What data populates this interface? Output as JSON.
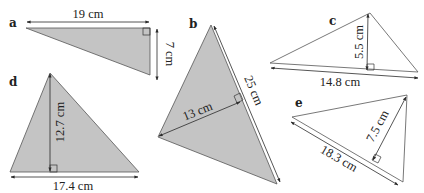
{
  "colors": {
    "shaded_fill": "#c4c4c4",
    "white_fill": "#ffffff",
    "stroke": "#3a3a3a"
  },
  "triangles": [
    {
      "id": "a",
      "label": "a",
      "fill": "shaded",
      "base_label": "19 cm",
      "height_label": "7 cm"
    },
    {
      "id": "b",
      "label": "b",
      "fill": "shaded",
      "base_label": "25 cm",
      "height_label": "13 cm"
    },
    {
      "id": "c",
      "label": "c",
      "fill": "white",
      "base_label": "14.8 cm",
      "height_label": "5.5 cm"
    },
    {
      "id": "d",
      "label": "d",
      "fill": "shaded",
      "base_label": "17.4 cm",
      "height_label": "12.7 cm"
    },
    {
      "id": "e",
      "label": "e",
      "fill": "white",
      "base_label": "18.3 cm",
      "height_label": "7.5 cm"
    }
  ]
}
